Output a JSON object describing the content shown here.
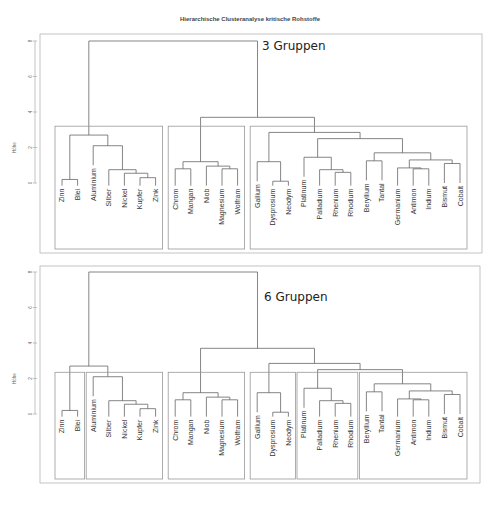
{
  "chart_data": {
    "type": "dendrogram",
    "title": "Hierarchische Clusteranalyse kritische Rohstoffe",
    "ylabel": "Höhe",
    "yticks": [
      0,
      2,
      4,
      6,
      8
    ],
    "ylim": [
      0,
      8
    ],
    "leaves": [
      "Zinn",
      "Blei",
      "Aluminium",
      "Silber",
      "Nickel",
      "Kupfer",
      "Zink",
      "Chrom",
      "Mangan",
      "Niob",
      "Magnesium",
      "Wolfram",
      "Gallium",
      "Dysprosium",
      "Neodym",
      "Platinum",
      "Palladium",
      "Rhenium",
      "Rhodium",
      "Beryllium",
      "Tantal",
      "Germanium",
      "Antimon",
      "Indium",
      "Bismut",
      "Cobalt"
    ],
    "merges": [
      {
        "a": "Zinn",
        "b": "Blei",
        "id": "ZB",
        "h": 0.2
      },
      {
        "a": "Kupfer",
        "b": "Zink",
        "id": "KZ",
        "h": 0.3
      },
      {
        "a": "Nickel",
        "b": "KZ",
        "id": "NKZ",
        "h": 0.55
      },
      {
        "a": "Silber",
        "b": "NKZ",
        "id": "SNKZ",
        "h": 0.75
      },
      {
        "a": "Aluminium",
        "b": "SNKZ",
        "id": "AL",
        "h": 2.1
      },
      {
        "a": "ZB",
        "b": "AL",
        "id": "LEFT",
        "h": 2.7
      },
      {
        "a": "Chrom",
        "b": "Mangan",
        "id": "CM",
        "h": 0.8
      },
      {
        "a": "Magnesium",
        "b": "Wolfram",
        "id": "MW",
        "h": 0.8
      },
      {
        "a": "Niob",
        "b": "MW",
        "id": "NMW",
        "h": 0.95
      },
      {
        "a": "CM",
        "b": "NMW",
        "id": "MID",
        "h": 1.2
      },
      {
        "a": "Dysprosium",
        "b": "Neodym",
        "id": "DN",
        "h": 0.1
      },
      {
        "a": "Gallium",
        "b": "DN",
        "id": "GDN",
        "h": 1.2
      },
      {
        "a": "Rhenium",
        "b": "Rhodium",
        "id": "RR",
        "h": 0.6
      },
      {
        "a": "Palladium",
        "b": "RR",
        "id": "PRR",
        "h": 0.75
      },
      {
        "a": "Platinum",
        "b": "PRR",
        "id": "PT",
        "h": 1.45
      },
      {
        "a": "Beryllium",
        "b": "Tantal",
        "id": "BT",
        "h": 1.25
      },
      {
        "a": "Antimon",
        "b": "Indium",
        "id": "AI",
        "h": 0.8
      },
      {
        "a": "Germanium",
        "b": "AI",
        "id": "GAI",
        "h": 0.85
      },
      {
        "a": "Bismut",
        "b": "Cobalt",
        "id": "BC",
        "h": 1.1
      },
      {
        "a": "GAI",
        "b": "BC",
        "id": "GB",
        "h": 1.3
      },
      {
        "a": "BT",
        "b": "GB",
        "id": "BE",
        "h": 1.7
      },
      {
        "a": "PT",
        "b": "BE",
        "id": "PB",
        "h": 2.5
      },
      {
        "a": "GDN",
        "b": "PB",
        "id": "RIGHT",
        "h": 2.85
      },
      {
        "a": "MID",
        "b": "RIGHT",
        "id": "MR",
        "h": 3.7
      },
      {
        "a": "LEFT",
        "b": "MR",
        "id": "ROOT",
        "h": 8.0
      }
    ],
    "panels": [
      {
        "label": "3 Gruppen",
        "groups": [
          [
            "Zinn",
            "Zink"
          ],
          [
            "Chrom",
            "Wolfram"
          ],
          [
            "Gallium",
            "Cobalt"
          ]
        ],
        "cut": 3.2
      },
      {
        "label": "6 Gruppen",
        "groups": [
          [
            "Zinn",
            "Blei"
          ],
          [
            "Aluminium",
            "Zink"
          ],
          [
            "Chrom",
            "Wolfram"
          ],
          [
            "Gallium",
            "Neodym"
          ],
          [
            "Platinum",
            "Rhodium"
          ],
          [
            "Beryllium",
            "Cobalt"
          ]
        ],
        "cut": 2.35
      }
    ]
  }
}
